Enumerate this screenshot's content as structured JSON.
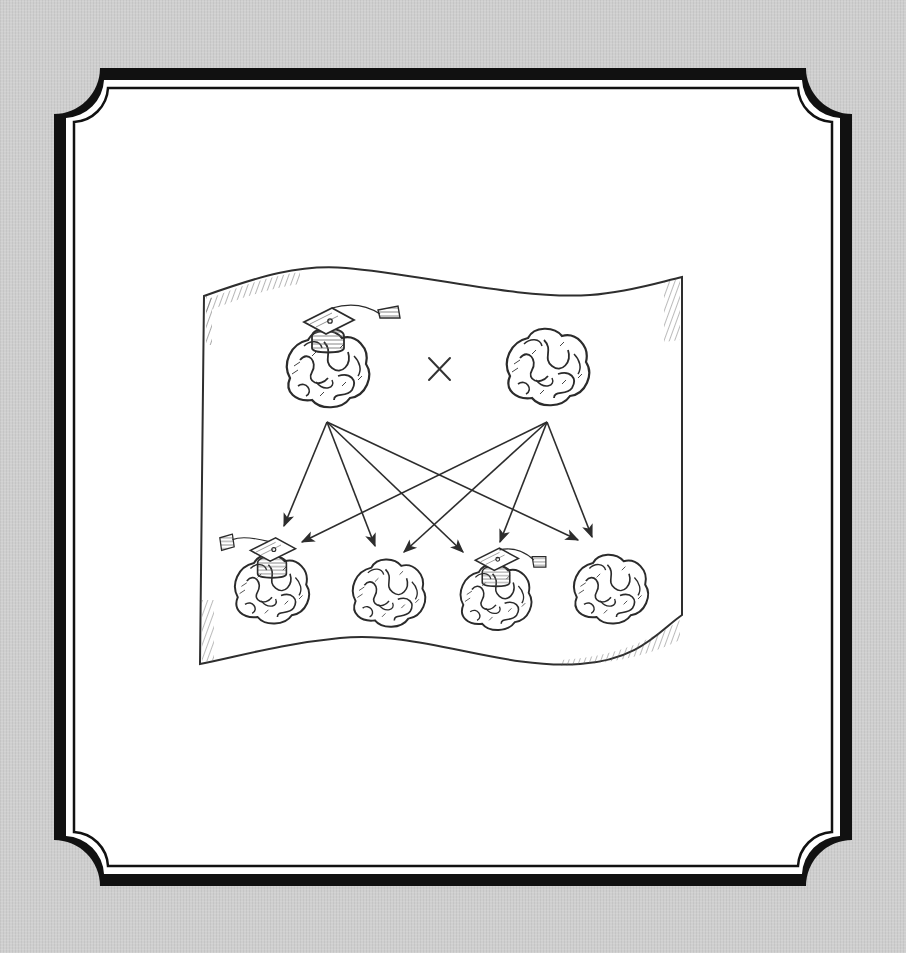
{
  "figure": {
    "operator_symbol": "×",
    "colors": {
      "background": "#cfcfcf",
      "frame_outer": "#111111",
      "frame_inner_fill": "#ffffff",
      "ink": "#333333"
    }
  },
  "diagram": {
    "parents": [
      {
        "id": "parent-1",
        "label": "educated-brain",
        "has_graduation_cap": true
      },
      {
        "id": "parent-2",
        "label": "plain-brain",
        "has_graduation_cap": false
      }
    ],
    "offspring": [
      {
        "id": "child-1",
        "has_graduation_cap": true
      },
      {
        "id": "child-2",
        "has_graduation_cap": false
      },
      {
        "id": "child-3",
        "has_graduation_cap": true
      },
      {
        "id": "child-4",
        "has_graduation_cap": false
      }
    ],
    "arrows": [
      {
        "from": "parent-1",
        "to": "child-1"
      },
      {
        "from": "parent-1",
        "to": "child-2"
      },
      {
        "from": "parent-1",
        "to": "child-3"
      },
      {
        "from": "parent-1",
        "to": "child-4"
      },
      {
        "from": "parent-2",
        "to": "child-1"
      },
      {
        "from": "parent-2",
        "to": "child-2"
      },
      {
        "from": "parent-2",
        "to": "child-3"
      },
      {
        "from": "parent-2",
        "to": "child-4"
      }
    ]
  }
}
